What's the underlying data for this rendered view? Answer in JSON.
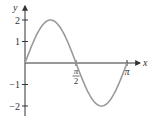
{
  "chart_data": {
    "type": "line",
    "title": "",
    "function": "y = 2 sin(2x)",
    "xlabel": "x",
    "ylabel": "y",
    "xlim": [
      0,
      3.1416
    ],
    "ylim": [
      -2.2,
      2.2
    ],
    "grid": false,
    "legend": null,
    "x_ticks": [
      {
        "value": 1.5708,
        "num": "π",
        "den": "2"
      },
      {
        "value": 3.1416,
        "label": "π"
      }
    ],
    "y_ticks": [
      {
        "value": 2,
        "label": "2"
      },
      {
        "value": 1,
        "label": "1"
      },
      {
        "value": -1,
        "label": "−1"
      },
      {
        "value": -2,
        "label": "−2"
      }
    ],
    "series": [
      {
        "name": "2 sin 2x",
        "color": "#9a9a9a",
        "x": [
          0,
          0.3927,
          0.7854,
          1.1781,
          1.5708,
          1.9635,
          2.3562,
          2.7489,
          3.1416
        ],
        "y": [
          0,
          1.414,
          2,
          1.414,
          0,
          -1.414,
          -2,
          -1.414,
          0
        ]
      }
    ]
  },
  "axis_color": "#333333"
}
